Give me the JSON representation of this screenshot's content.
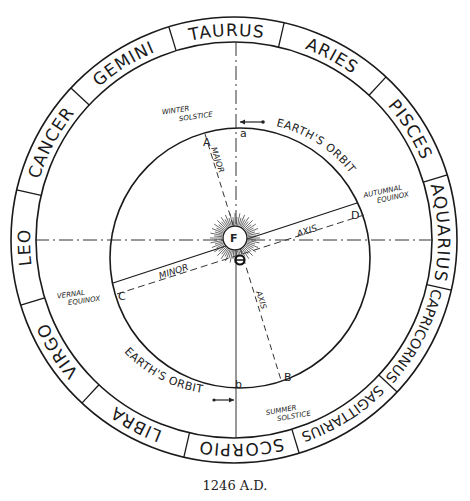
{
  "diagram": {
    "caption": "1246 A.D.",
    "zodiac": [
      {
        "name": "TAURUS",
        "angle": 0
      },
      {
        "name": "ARIES",
        "angle": 30
      },
      {
        "name": "PISCES",
        "angle": 60
      },
      {
        "name": "AQUARIUS",
        "angle": 90
      },
      {
        "name": "CAPRICORNUS",
        "angle": 120
      },
      {
        "name": "SAGITTARIUS",
        "angle": 150
      },
      {
        "name": "SCORPIO",
        "angle": 180
      },
      {
        "name": "LIBRA",
        "angle": 210
      },
      {
        "name": "VIRGO",
        "angle": 240
      },
      {
        "name": "LEO",
        "angle": 270
      },
      {
        "name": "CANCER",
        "angle": 300
      },
      {
        "name": "GEMINI",
        "angle": 330
      }
    ],
    "labels": {
      "winter_solstice_1": "WINTER",
      "winter_solstice_2": "SOLSTICE",
      "summer_solstice_1": "SUMMER",
      "summer_solstice_2": "SOLSTICE",
      "vernal_equinox_1": "VERNAL",
      "vernal_equinox_2": "EQUINOX",
      "autumnal_equinox_1": "AUTUMNAL",
      "autumnal_equinox_2": "EQUINOX",
      "earths_orbit_top": "EARTH'S ORBIT",
      "earths_orbit_bottom": "EARTH'S ORBIT",
      "major": "MAJOR",
      "minor": "MINOR",
      "axis_1": "AXIS",
      "axis_2": "AXIS",
      "focus": "F"
    },
    "points": {
      "A": "A",
      "B": "B",
      "C": "C",
      "D": "D",
      "a": "a",
      "b": "b"
    }
  }
}
